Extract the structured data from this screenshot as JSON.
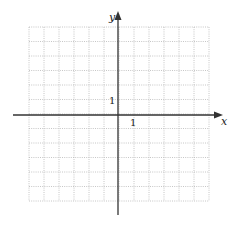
{
  "diagram": {
    "type": "coordinate-grid",
    "grid": {
      "cols": 12,
      "rows": 12,
      "x_min": -6,
      "x_max": 6,
      "y_min": -6,
      "y_max": 6,
      "line_style": "dotted",
      "line_color": "#b8b8b8"
    },
    "axes": {
      "color": "#333333",
      "x_label": "x",
      "y_label": "y"
    },
    "ticks": {
      "x_unit_label": "1",
      "y_unit_label": "1"
    }
  }
}
